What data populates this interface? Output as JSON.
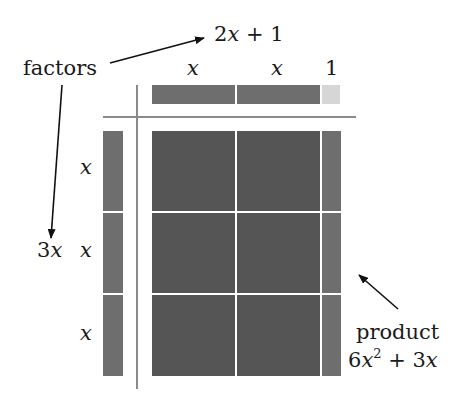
{
  "labels": {
    "factors": "factors",
    "top_factor": "2x + 1",
    "top_factor_parts": {
      "coef": "2",
      "var": "x",
      "op": " + ",
      "const": "1"
    },
    "left_factor_coef": "3",
    "left_factor_var": "x",
    "col_x1": "x",
    "col_x2": "x",
    "col_1": "1",
    "row_x1": "x",
    "row_x2": "x",
    "row_x3": "x",
    "product": "product",
    "product_expr": {
      "coef1": "6",
      "var1": "x",
      "exp": "2",
      "op": " + ",
      "coef2": "3",
      "var2": "x"
    }
  },
  "colors": {
    "x_squared_tile": "#555555",
    "x_tile": "#6e6e6e",
    "unit_tile": "#d6d6d6",
    "axis_line": "#8a8a8a",
    "divider": "#e8e8e8"
  },
  "grid": {
    "rows": 3,
    "cols": [
      "x",
      "x",
      "1"
    ]
  }
}
